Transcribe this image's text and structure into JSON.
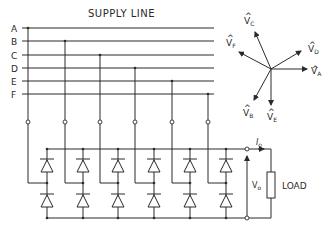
{
  "diagram": {
    "title": "SUPPLY LINE",
    "lines": [
      {
        "label": "A",
        "y": 28
      },
      {
        "label": "B",
        "y": 41
      },
      {
        "label": "C",
        "y": 55
      },
      {
        "label": "D",
        "y": 68
      },
      {
        "label": "E",
        "y": 81
      },
      {
        "label": "F",
        "y": 94
      }
    ],
    "phasors": [
      {
        "name": "V",
        "sub": "A"
      },
      {
        "name": "V",
        "sub": "B"
      },
      {
        "name": "V",
        "sub": "C"
      },
      {
        "name": "V",
        "sub": "D"
      },
      {
        "name": "V",
        "sub": "E"
      },
      {
        "name": "V",
        "sub": "F"
      }
    ],
    "output": {
      "current_label": "I",
      "current_sub": "o",
      "voltage_label": "V",
      "voltage_sub": "o",
      "load_label": "LOAD"
    },
    "stroke_color": "#2a2a2a"
  }
}
